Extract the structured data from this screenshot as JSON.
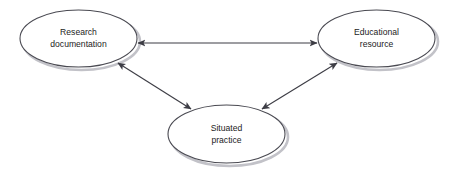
{
  "diagram": {
    "type": "triangular-relationship-diagram",
    "background_color": "#ffffff",
    "node_fill": "#ffffff",
    "node_stroke": "#4a4a52",
    "edge_color": "#3d3d45",
    "text_color": "#1c1c1c",
    "shadow_color": "#b9b9bf",
    "nodes": [
      {
        "id": "research-documentation",
        "lines": [
          "Research",
          "documentation"
        ],
        "cx": 78.5,
        "cy": 38.5,
        "rx": 58.5,
        "ry": 28.5
      },
      {
        "id": "educational-resource",
        "lines": [
          "Educational",
          "resource"
        ],
        "cx": 376.5,
        "cy": 38.5,
        "rx": 58.5,
        "ry": 28.5
      },
      {
        "id": "situated-practice",
        "lines": [
          "Situated",
          "practice"
        ],
        "cx": 226.5,
        "cy": 134.0,
        "rx": 58.5,
        "ry": 29.0
      }
    ],
    "edges": [
      {
        "id": "research-documentation--educational-resource",
        "from": "research-documentation",
        "to": "educational-resource",
        "arrowheads": "both",
        "x1": 138,
        "y1": 43,
        "x2": 317,
        "y2": 43
      },
      {
        "id": "research-documentation--situated-practice",
        "from": "research-documentation",
        "to": "situated-practice",
        "arrowheads": "both",
        "x1": 118,
        "y1": 63,
        "x2": 191,
        "y2": 109
      },
      {
        "id": "situated-practice--educational-resource",
        "from": "situated-practice",
        "to": "educational-resource",
        "arrowheads": "both",
        "x1": 262,
        "y1": 109,
        "x2": 337,
        "y2": 63
      }
    ]
  }
}
